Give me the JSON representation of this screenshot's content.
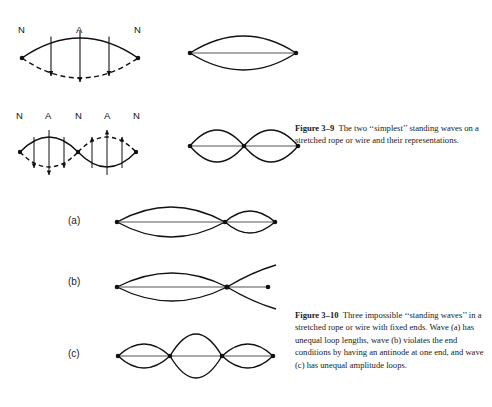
{
  "page": {
    "background_color": "#ffffff",
    "ink_color": "#111111",
    "width": 492,
    "height": 407
  },
  "figures": [
    {
      "id": "figure-3-9",
      "caption_label": "Figure 3–9",
      "caption_text": "The two ‘‘simplest’’ standing waves on a stretched rope or wire and their representations.",
      "caption_full": "Figure 3–9   The two ‘‘simplest’’ standing waves on a stretched rope or wire and their representations.",
      "rows": [
        {
          "id": "row-fundamental",
          "node_antinode_labels": [
            "N",
            "A",
            "N"
          ],
          "loops": 1,
          "representation_loops": 1
        },
        {
          "id": "row-second-harmonic",
          "node_antinode_labels": [
            "N",
            "A",
            "N",
            "A",
            "N"
          ],
          "loops": 2,
          "representation_loops": 2
        }
      ]
    },
    {
      "id": "figure-3-10",
      "caption_label": "Figure 3–10",
      "caption_text": "Three impossible ‘‘standing waves’’ in a stretched rope or wire with fixed ends. Wave (a) has unequal loop lengths, wave (b) violates the end conditions by having an antinode at one end, and wave (c) has unequal amplitude loops.",
      "caption_full": "Figure 3–10   Three impossible ‘‘standing waves’’ in a stretched rope or wire with fixed ends. Wave (a) has unequal loop lengths, wave (b) violates the end conditions by having an antinode at one end, and wave (c) has unequal amplitude loops.",
      "panels": [
        {
          "id": "panel-a",
          "label": "(a)",
          "description": "unequal loop lengths"
        },
        {
          "id": "panel-b",
          "label": "(b)",
          "description": "antinode at one end"
        },
        {
          "id": "panel-c",
          "label": "(c)",
          "description": "unequal amplitude loops"
        }
      ]
    }
  ],
  "labels": {
    "N": "N",
    "A": "A",
    "panel_a": "(a)",
    "panel_b": "(b)",
    "panel_c": "(c)"
  },
  "node_labels_row1": [
    {
      "text": "N",
      "x": 20,
      "y": 24
    },
    {
      "text": "A",
      "x": 78,
      "y": 24
    },
    {
      "text": "N",
      "x": 136,
      "y": 24
    }
  ],
  "node_labels_row2": [
    {
      "text": "N",
      "x": 18,
      "y": 110
    },
    {
      "text": "A",
      "x": 48,
      "y": 110
    },
    {
      "text": "N",
      "x": 78,
      "y": 110
    },
    {
      "text": "A",
      "x": 108,
      "y": 110
    },
    {
      "text": "N",
      "x": 138,
      "y": 110
    }
  ]
}
